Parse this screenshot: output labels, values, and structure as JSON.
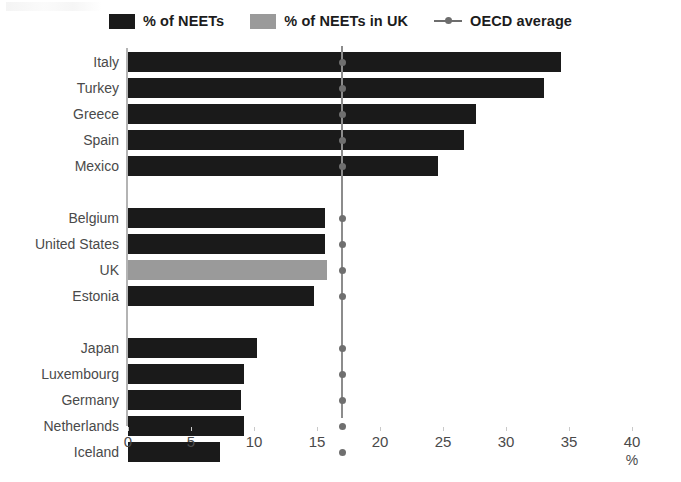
{
  "chart_data": {
    "type": "bar",
    "orientation": "horizontal",
    "title": "",
    "xlabel": "%",
    "ylabel": "",
    "xlim": [
      0,
      40
    ],
    "xticks": [
      0,
      5,
      10,
      15,
      20,
      25,
      30,
      35,
      40
    ],
    "grid": false,
    "categories": [
      "Italy",
      "Turkey",
      "Greece",
      "Spain",
      "Mexico",
      "Belgium",
      "United States",
      "UK",
      "Estonia",
      "Japan",
      "Luxembourg",
      "Germany",
      "Netherlands",
      "Iceland"
    ],
    "values": [
      34.4,
      33.0,
      27.6,
      26.7,
      24.6,
      15.6,
      15.6,
      15.8,
      14.8,
      10.2,
      9.2,
      9.0,
      9.2,
      7.3
    ],
    "groups": [
      {
        "name": "high",
        "categories": [
          "Italy",
          "Turkey",
          "Greece",
          "Spain",
          "Mexico"
        ]
      },
      {
        "name": "middle",
        "categories": [
          "Belgium",
          "United States",
          "UK",
          "Estonia"
        ]
      },
      {
        "name": "low",
        "categories": [
          "Japan",
          "Luxembourg",
          "Germany",
          "Netherlands",
          "Iceland"
        ]
      }
    ],
    "highlight": {
      "category": "UK",
      "series": "% of NEETs in UK"
    },
    "reference_line": {
      "label": "OECD average",
      "value": 17.0
    },
    "series": [
      {
        "name": "% of NEETs",
        "color": "#1a1a1a"
      },
      {
        "name": "% of NEETs in UK",
        "color": "#9a9a9a"
      }
    ],
    "legend": {
      "position": "top",
      "entries": [
        {
          "label": "% of NEETs",
          "marker": "square",
          "color": "#1a1a1a"
        },
        {
          "label": "% of NEETs in UK",
          "marker": "square",
          "color": "#9a9a9a"
        },
        {
          "label": "OECD average",
          "marker": "line-dot",
          "color": "#6d6d6d"
        }
      ]
    }
  }
}
